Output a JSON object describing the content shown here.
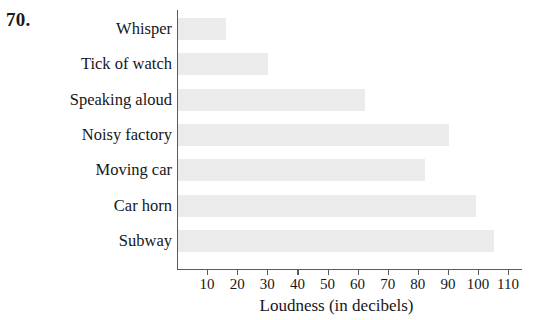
{
  "problem": {
    "number": "70."
  },
  "chart_data": {
    "type": "bar",
    "orientation": "horizontal",
    "title": "",
    "subtitle": "",
    "xlabel": "Loudness (in decibels)",
    "ylabel": "",
    "categories": [
      "Whisper",
      "Tick of watch",
      "Speaking aloud",
      "Noisy factory",
      "Moving car",
      "Car horn",
      "Subway"
    ],
    "values": [
      16,
      30,
      62,
      90,
      82,
      99,
      105
    ],
    "xticks": [
      10,
      20,
      30,
      40,
      50,
      60,
      70,
      80,
      90,
      100,
      110
    ],
    "xticklabels": [
      "10",
      "20",
      "30",
      "40",
      "50",
      "60",
      "70",
      "80",
      "90",
      "100",
      "110"
    ],
    "xlim": [
      0,
      114
    ],
    "grid": false,
    "legend": false,
    "bar_color": "#ebebec",
    "axis_color": "#5b5b5b",
    "text_color": "#16161a"
  }
}
